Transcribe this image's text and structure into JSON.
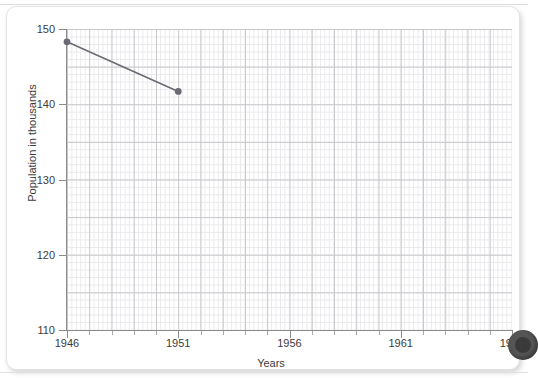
{
  "chart_data": {
    "type": "line",
    "title": "",
    "xlabel": "Years",
    "ylabel": "Population in thousands",
    "x": [
      1946,
      1951
    ],
    "values": [
      148.3,
      141.7
    ],
    "series": [
      {
        "name": "Population",
        "x": [
          1946,
          1951
        ],
        "values": [
          148.3,
          141.7
        ],
        "color": "#6b6b75",
        "marker": "circle"
      }
    ],
    "xlim": [
      1946,
      1966
    ],
    "ylim": [
      110,
      150
    ],
    "xticks": [
      1946,
      1951,
      1956,
      1961,
      1966
    ],
    "yticks": [
      110,
      120,
      130,
      140,
      150
    ],
    "xtick_labels": [
      "1946",
      "1951",
      "1956",
      "1961",
      "1966"
    ],
    "ytick_labels": [
      "110",
      "120",
      "130",
      "140",
      "150"
    ],
    "x_minor_step": 1,
    "y_minor_step": 1,
    "grid": true,
    "grid_style": "graph-paper",
    "legend": false,
    "legend_position": "none"
  },
  "colors": {
    "grid_major": "#c8c8cc",
    "grid_minor": "#e9e9ec",
    "axis": "#8a8a8a",
    "text": "#3c3c3c",
    "series": "#6b6b75",
    "page": "#ffffff",
    "sheet_border": "#e3e3e3",
    "edge_dot": "#555555"
  },
  "axes": {
    "y_label": "Population in thousands",
    "x_label": "Years"
  }
}
